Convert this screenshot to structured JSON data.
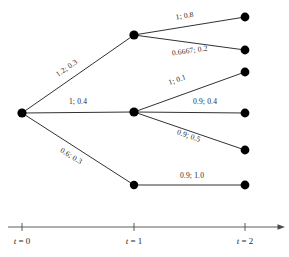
{
  "figure": {
    "type": "diagram",
    "width": 289,
    "height": 257,
    "background_color": "#ffffff",
    "node_color": "#000000",
    "edge_color": "#1a1a1a",
    "axis_color": "#4a4a4a"
  },
  "stages": [
    {
      "id": "t0",
      "label_t": "t",
      "label_eq": "=",
      "label_value": "0",
      "x": 22
    },
    {
      "id": "t1",
      "label_t": "t",
      "label_eq": "=",
      "label_value": "1",
      "x": 134
    },
    {
      "id": "t2",
      "label_t": "t",
      "label_eq": "=",
      "label_value": "2",
      "x": 245
    }
  ],
  "axis": {
    "y": 227,
    "x_start": 8,
    "x_end": 280,
    "tick_half_height": 4,
    "arrow": true
  },
  "nodes": [
    {
      "id": "n0",
      "stage": 0,
      "x": 22,
      "y": 113,
      "r": 4.6
    },
    {
      "id": "n1",
      "stage": 1,
      "x": 134,
      "y": 35,
      "r": 4.6
    },
    {
      "id": "n2",
      "stage": 1,
      "x": 134,
      "y": 112,
      "r": 4.6
    },
    {
      "id": "n3",
      "stage": 1,
      "x": 134,
      "y": 185,
      "r": 4.2
    },
    {
      "id": "n4",
      "stage": 2,
      "x": 245,
      "y": 17,
      "r": 4.4
    },
    {
      "id": "n5",
      "stage": 2,
      "x": 245,
      "y": 50,
      "r": 4.4
    },
    {
      "id": "n6",
      "stage": 2,
      "x": 245,
      "y": 72,
      "r": 4.4
    },
    {
      "id": "n7",
      "stage": 2,
      "x": 245,
      "y": 113,
      "r": 4.4
    },
    {
      "id": "n8",
      "stage": 2,
      "x": 245,
      "y": 150,
      "r": 4.4
    },
    {
      "id": "n9",
      "stage": 2,
      "x": 245,
      "y": 185,
      "r": 4.4
    }
  ],
  "edges": [
    {
      "id": "e0-1",
      "from": "n0",
      "to": "n1",
      "label": "1.2; 0.3",
      "value": 1.2,
      "probability": 0.3,
      "label_x": 68,
      "label_y": 70,
      "rotation": -35,
      "anchor": "middle"
    },
    {
      "id": "e0-2",
      "from": "n0",
      "to": "n2",
      "label": "1; 0.4",
      "value": 1,
      "probability": 0.4,
      "label_x": 78,
      "label_y": 104,
      "rotation": 0,
      "anchor": "middle"
    },
    {
      "id": "e0-3",
      "from": "n0",
      "to": "n3",
      "label": "0.6; 0.3",
      "value": 0.6,
      "probability": 0.3,
      "label_x": 70,
      "label_y": 158,
      "rotation": 32,
      "anchor": "middle"
    },
    {
      "id": "e1-4",
      "from": "n1",
      "to": "n4",
      "label": "1; 0.8",
      "value": 1,
      "probability": 0.8,
      "label_x": 185,
      "label_y": 18,
      "rotation": -9,
      "anchor": "middle"
    },
    {
      "id": "e1-5",
      "from": "n1",
      "to": "n5",
      "label": "0.6667; 0.2",
      "value": 0.6667,
      "probability": 0.2,
      "label_x": 190,
      "label_y": 53,
      "rotation": -8,
      "anchor": "middle"
    },
    {
      "id": "e2-6",
      "from": "n2",
      "to": "n6",
      "label": "1; 0.1",
      "value": 1,
      "probability": 0.1,
      "label_x": 178,
      "label_y": 82,
      "rotation": -20,
      "anchor": "middle"
    },
    {
      "id": "e2-7",
      "from": "n2",
      "to": "n7",
      "label": "0.9; 0.4",
      "value": 0.9,
      "probability": 0.4,
      "label_x": 205,
      "label_y": 104,
      "rotation": 0,
      "anchor": "middle"
    },
    {
      "id": "e2-8",
      "from": "n2",
      "to": "n8",
      "label": "0.9; 0.5",
      "value": 0.9,
      "probability": 0.5,
      "label_x": 188,
      "label_y": 138,
      "rotation": 19,
      "anchor": "middle"
    },
    {
      "id": "e3-9",
      "from": "n3",
      "to": "n9",
      "label": "0.9; 1.0",
      "value": 0.9,
      "probability": 1.0,
      "label_x": 192,
      "label_y": 178,
      "rotation": 0,
      "anchor": "middle"
    }
  ]
}
